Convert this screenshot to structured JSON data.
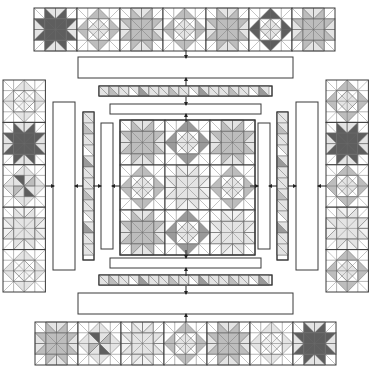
{
  "diagram": {
    "width": 370,
    "height": 375,
    "colors": {
      "outline": "#3a3a3a",
      "grid": "#6a6a6a",
      "white": "#ffffff",
      "light": "#e4e4e4",
      "medium": "#bdbdbd",
      "mediumdark": "#9a9a9a",
      "dark": "#5e5e5e",
      "arrow": "#222222"
    },
    "block_types": [
      "star",
      "diamond"
    ],
    "top_row": {
      "x": 34,
      "y": 8,
      "block_size": 43,
      "blocks": [
        {
          "type": "star",
          "shade": "dark"
        },
        {
          "type": "diamond",
          "shade": "medium"
        },
        {
          "type": "star",
          "shade": "medium"
        },
        {
          "type": "diamond",
          "shade": "medium"
        },
        {
          "type": "star",
          "shade": "medium"
        },
        {
          "type": "diamond",
          "shade": "dark"
        },
        {
          "type": "star",
          "shade": "medium"
        }
      ]
    },
    "bottom_row": {
      "x": 35,
      "y": 322,
      "block_size": 43,
      "blocks": [
        {
          "type": "star",
          "shade": "medium"
        },
        {
          "type": "pinwheel",
          "shade": "dark"
        },
        {
          "type": "star",
          "shade": "light"
        },
        {
          "type": "diamond",
          "shade": "medium"
        },
        {
          "type": "star",
          "shade": "medium"
        },
        {
          "type": "diamond",
          "shade": "light"
        },
        {
          "type": "star",
          "shade": "dark"
        }
      ]
    },
    "left_column": {
      "x": 3,
      "y": 80,
      "block_size": 42.4,
      "blocks": [
        {
          "type": "diamond",
          "shade": "light"
        },
        {
          "type": "star",
          "shade": "dark"
        },
        {
          "type": "pinwheel",
          "shade": "dark"
        },
        {
          "type": "star",
          "shade": "light"
        },
        {
          "type": "diamond",
          "shade": "light"
        }
      ]
    },
    "right_column": {
      "x": 326,
      "y": 80,
      "block_size": 42.4,
      "blocks": [
        {
          "type": "diamond",
          "shade": "medium"
        },
        {
          "type": "star",
          "shade": "dark"
        },
        {
          "type": "diamond",
          "shade": "medium"
        },
        {
          "type": "star",
          "shade": "light"
        },
        {
          "type": "diamond",
          "shade": "medium"
        }
      ]
    },
    "center": {
      "x": 120,
      "y": 120,
      "block_size": 45,
      "blocks": [
        {
          "type": "star",
          "shade": "medium"
        },
        {
          "type": "diamond",
          "shade": "mediumdark"
        },
        {
          "type": "star",
          "shade": "medium"
        },
        {
          "type": "diamond",
          "shade": "medium"
        },
        {
          "type": "star",
          "shade": "light"
        },
        {
          "type": "diamond",
          "shade": "medium"
        },
        {
          "type": "star",
          "shade": "medium"
        },
        {
          "type": "diamond",
          "shade": "mediumdark"
        },
        {
          "type": "star",
          "shade": "light"
        }
      ]
    },
    "borders": {
      "top": [
        {
          "kind": "plain",
          "x": 78,
          "y": 57,
          "w": 215,
          "h": 21
        },
        {
          "kind": "pieced",
          "x": 99,
          "y": 86,
          "w": 173,
          "h": 10
        },
        {
          "kind": "plain",
          "x": 110,
          "y": 104,
          "w": 151,
          "h": 10
        }
      ],
      "bottom": [
        {
          "kind": "plain",
          "x": 110,
          "y": 258,
          "w": 151,
          "h": 10
        },
        {
          "kind": "pieced",
          "x": 99,
          "y": 275,
          "w": 173,
          "h": 10
        },
        {
          "kind": "plain",
          "x": 78,
          "y": 293,
          "w": 215,
          "h": 21
        }
      ],
      "left": [
        {
          "kind": "plain",
          "x": 53,
          "y": 102,
          "w": 22,
          "h": 168
        },
        {
          "kind": "pieced",
          "x": 83,
          "y": 112,
          "w": 11,
          "h": 148
        },
        {
          "kind": "plain",
          "x": 101,
          "y": 123,
          "w": 12,
          "h": 126
        }
      ],
      "right": [
        {
          "kind": "plain",
          "x": 258,
          "y": 123,
          "w": 12,
          "h": 126
        },
        {
          "kind": "pieced",
          "x": 277,
          "y": 112,
          "w": 11,
          "h": 148
        },
        {
          "kind": "plain",
          "x": 296,
          "y": 102,
          "w": 22,
          "h": 168
        }
      ]
    },
    "arrows": {
      "vertical_x": 186,
      "horizontal_y": 186,
      "top_y": [
        54,
        82,
        101,
        118
      ],
      "bottom_y": [
        254,
        272,
        290,
        318
      ],
      "left_x": [
        50,
        79,
        97,
        116
      ],
      "right_x": [
        254,
        273,
        292,
        322
      ]
    }
  }
}
